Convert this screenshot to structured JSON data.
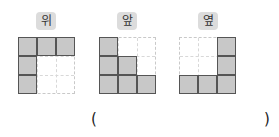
{
  "views": [
    {
      "label": "위",
      "cells": [
        [
          1,
          1,
          1
        ],
        [
          1,
          0,
          0
        ],
        [
          1,
          0,
          0
        ]
      ]
    },
    {
      "label": "앞",
      "cells": [
        [
          1,
          0,
          0
        ],
        [
          1,
          1,
          0
        ],
        [
          1,
          1,
          1
        ]
      ]
    },
    {
      "label": "옆",
      "cells": [
        [
          0,
          0,
          1
        ],
        [
          0,
          0,
          1
        ],
        [
          1,
          1,
          1
        ]
      ]
    }
  ],
  "answer": {
    "open": "(",
    "close": ")",
    "value": ""
  },
  "colors": {
    "filled": "#c8c8c8",
    "border": "#555555",
    "badge": "#dcdcdc"
  }
}
